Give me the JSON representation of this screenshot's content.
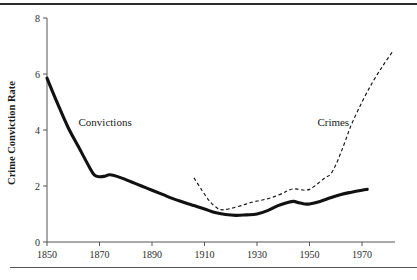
{
  "figure": {
    "rule_top_label": "top-rule",
    "rule_bottom_label": "bottom-rule"
  },
  "chart_data": {
    "type": "line",
    "title": "",
    "xlabel": "",
    "ylabel": "Crime Conviction Rate",
    "xlim": [
      1850,
      1983
    ],
    "ylim": [
      0,
      8
    ],
    "xticks": [
      1850,
      1870,
      1890,
      1910,
      1930,
      1950,
      1970
    ],
    "xticklabels": [
      "1850",
      "1870",
      "1890",
      "1910",
      "1930",
      "1950",
      "1970"
    ],
    "yticks": [
      0,
      2,
      4,
      6,
      8
    ],
    "yticklabels": [
      "0",
      "2",
      "4",
      "6",
      "8"
    ],
    "grid": false,
    "legend": "inline-annotations",
    "annotations": [
      {
        "text": "Convictions",
        "x": 1862,
        "y": 4.15
      },
      {
        "text": "Crimes",
        "x": 1953,
        "y": 4.15
      }
    ],
    "series": [
      {
        "name": "Convictions",
        "style": "solid",
        "color": "#111111",
        "x": [
          1850,
          1854,
          1858,
          1862,
          1866,
          1868,
          1870,
          1872,
          1874,
          1878,
          1882,
          1886,
          1890,
          1894,
          1898,
          1902,
          1906,
          1910,
          1914,
          1918,
          1922,
          1926,
          1930,
          1934,
          1938,
          1942,
          1944,
          1946,
          1948,
          1950,
          1954,
          1958,
          1962,
          1966,
          1970,
          1972
        ],
        "y": [
          5.85,
          4.95,
          4.1,
          3.4,
          2.7,
          2.4,
          2.33,
          2.35,
          2.4,
          2.3,
          2.15,
          2.0,
          1.85,
          1.7,
          1.55,
          1.42,
          1.3,
          1.18,
          1.05,
          0.98,
          0.95,
          0.97,
          1.0,
          1.12,
          1.3,
          1.42,
          1.45,
          1.4,
          1.36,
          1.36,
          1.45,
          1.58,
          1.7,
          1.78,
          1.85,
          1.88
        ]
      },
      {
        "name": "Crimes",
        "style": "dashed",
        "color": "#111111",
        "x": [
          1906,
          1909,
          1912,
          1915,
          1917,
          1920,
          1924,
          1928,
          1932,
          1936,
          1940,
          1942,
          1944,
          1946,
          1948,
          1950,
          1952,
          1954,
          1956,
          1958,
          1960,
          1962,
          1964,
          1966,
          1970,
          1974,
          1978,
          1982
        ],
        "y": [
          2.29,
          1.85,
          1.45,
          1.2,
          1.15,
          1.2,
          1.3,
          1.42,
          1.5,
          1.6,
          1.75,
          1.85,
          1.9,
          1.88,
          1.85,
          1.88,
          2.0,
          2.15,
          2.3,
          2.42,
          2.75,
          3.2,
          3.7,
          4.2,
          5.0,
          5.7,
          6.3,
          6.85
        ]
      }
    ]
  }
}
